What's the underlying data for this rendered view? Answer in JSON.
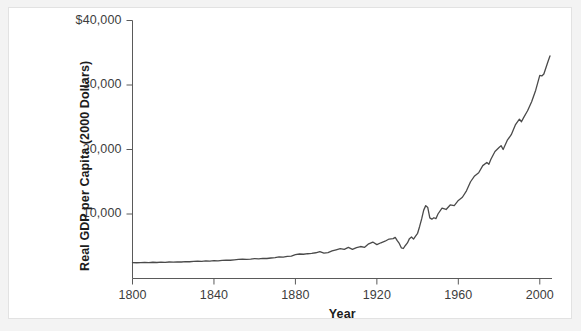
{
  "figure": {
    "background_color": "#f3f3f3",
    "panel_color": "#ffffff",
    "panel_border_color": "#e2e2e2"
  },
  "chart_data": {
    "type": "line",
    "title": "",
    "subtitle": "",
    "xlabel": "Year",
    "ylabel": "Real GDP per Capita (2000 Dollars)",
    "xlim": [
      1800,
      2006
    ],
    "ylim": [
      0,
      40000
    ],
    "xticks": [
      1800,
      1840,
      1880,
      1920,
      1960,
      2000
    ],
    "xtick_labels": [
      "1800",
      "1840",
      "1880",
      "1920",
      "1960",
      "2000"
    ],
    "yticks": [
      10000,
      20000,
      30000,
      40000
    ],
    "ytick_labels": [
      "10,000",
      "20,000",
      "30,000",
      "$40,000"
    ],
    "grid": false,
    "legend": null,
    "legend_position": "none",
    "line_color": "#4a4a4a",
    "line_width": 1.3,
    "series": [
      {
        "name": "Real GDP per Capita",
        "x": [
          1800,
          1802,
          1804,
          1806,
          1808,
          1810,
          1812,
          1814,
          1816,
          1818,
          1820,
          1822,
          1824,
          1826,
          1828,
          1830,
          1832,
          1834,
          1836,
          1838,
          1840,
          1842,
          1844,
          1846,
          1848,
          1850,
          1852,
          1854,
          1856,
          1858,
          1860,
          1862,
          1864,
          1866,
          1868,
          1870,
          1872,
          1874,
          1876,
          1878,
          1880,
          1882,
          1884,
          1886,
          1888,
          1890,
          1892,
          1894,
          1896,
          1898,
          1900,
          1902,
          1904,
          1906,
          1908,
          1910,
          1912,
          1914,
          1916,
          1918,
          1920,
          1922,
          1924,
          1926,
          1928,
          1929,
          1930,
          1931,
          1932,
          1933,
          1934,
          1935,
          1936,
          1937,
          1938,
          1939,
          1940,
          1941,
          1942,
          1943,
          1944,
          1945,
          1946,
          1947,
          1948,
          1949,
          1950,
          1952,
          1954,
          1956,
          1958,
          1960,
          1962,
          1964,
          1966,
          1968,
          1970,
          1972,
          1974,
          1975,
          1976,
          1978,
          1980,
          1981,
          1982,
          1984,
          1986,
          1988,
          1990,
          1991,
          1992,
          1994,
          1996,
          1998,
          2000,
          2001,
          2002,
          2004,
          2005
        ],
        "values": [
          2460,
          2440,
          2470,
          2500,
          2460,
          2520,
          2480,
          2540,
          2500,
          2560,
          2530,
          2590,
          2560,
          2620,
          2600,
          2660,
          2690,
          2650,
          2720,
          2700,
          2780,
          2740,
          2820,
          2860,
          2830,
          2900,
          2950,
          2990,
          2960,
          3010,
          3080,
          3040,
          3120,
          3100,
          3180,
          3250,
          3340,
          3300,
          3420,
          3480,
          3700,
          3800,
          3760,
          3840,
          3900,
          3990,
          4150,
          3920,
          4020,
          4280,
          4450,
          4620,
          4520,
          4820,
          4520,
          4790,
          4960,
          4830,
          5380,
          5650,
          5250,
          5540,
          5780,
          6120,
          6180,
          6380,
          5860,
          5440,
          4760,
          4650,
          5120,
          5510,
          6180,
          6430,
          6110,
          6560,
          7010,
          8070,
          9240,
          10600,
          11300,
          11000,
          9400,
          9200,
          9420,
          9280,
          10000,
          10900,
          10700,
          11400,
          11300,
          12100,
          12600,
          13600,
          15000,
          15900,
          16400,
          17500,
          18000,
          17700,
          18500,
          19700,
          20300,
          20600,
          20000,
          21400,
          22300,
          23800,
          24700,
          24300,
          24900,
          26000,
          27400,
          29200,
          31500,
          31400,
          31700,
          33600,
          34500
        ]
      }
    ],
    "annotations": []
  }
}
